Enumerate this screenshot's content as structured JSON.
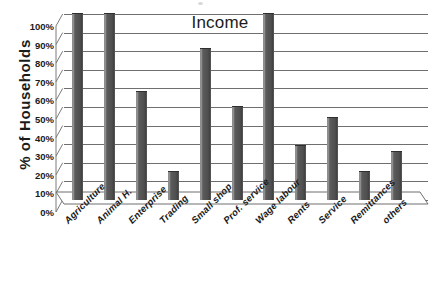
{
  "chart_data": {
    "type": "bar",
    "title": "Income",
    "xlabel": "",
    "ylabel": "% of Households",
    "ylim": [
      0,
      100
    ],
    "ytick_labels": [
      "100%",
      "90%",
      "80%",
      "70%",
      "60%",
      "50%",
      "40%",
      "30%",
      "20%",
      "10%",
      "0%"
    ],
    "ytick_values": [
      100,
      90,
      80,
      70,
      60,
      50,
      40,
      30,
      20,
      10,
      0
    ],
    "grid": true,
    "legend": "none",
    "categories": [
      "Agriculture",
      "Animal H.",
      "Enterprise",
      "Trading",
      "Small shop",
      "Prof. service",
      "Wage labour",
      "Rents",
      "Service",
      "Remittances",
      "others"
    ],
    "values": [
      100,
      100,
      58,
      15,
      81,
      50,
      100,
      29,
      44,
      15,
      26
    ],
    "bar_color": "#555555",
    "gridline_color": "#6f6f6f",
    "text_color": "#1b1b1b",
    "background_color": "#ffffff"
  }
}
